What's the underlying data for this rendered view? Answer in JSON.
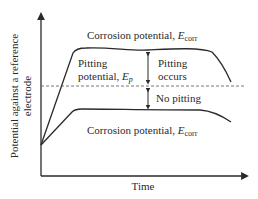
{
  "diagram": {
    "y_axis_label_line1": "Potential against a reference",
    "y_axis_label_line2": "electrode",
    "x_axis_label": "Time",
    "upper_curve_label": {
      "text": "Corrosion potential, ",
      "symbol": "E",
      "subscript": "corr"
    },
    "lower_curve_label": {
      "text": "Corrosion potential, ",
      "symbol": "E",
      "subscript": "corr"
    },
    "pitting_potential_label_line1": "Pitting",
    "pitting_potential_label_line2": {
      "text": "potential, ",
      "symbol": "E",
      "subscript": "p"
    },
    "pitting_occurs_line1": "Pitting",
    "pitting_occurs_line2": "occurs",
    "no_pitting": "No pitting",
    "colors": {
      "line": "#2a2a2a",
      "dashed": "#666666",
      "background": "#ffffff"
    }
  }
}
